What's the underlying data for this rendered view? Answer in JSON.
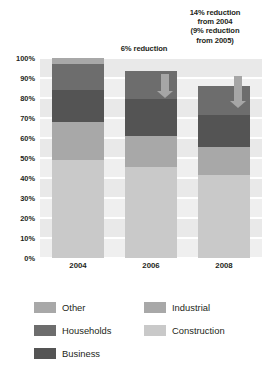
{
  "annotations": {
    "a2006": "6% reduction",
    "a2008": "14% reduction\nfrom 2004\n(9% reduction\nfrom 2005)"
  },
  "legend": {
    "items": [
      {
        "label": "Other",
        "color": "#a8a8a8"
      },
      {
        "label": "Households",
        "color": "#6d6d6d"
      },
      {
        "label": "Business",
        "color": "#545454"
      },
      {
        "label": "Industrial",
        "color": "#a8a8a8"
      },
      {
        "label": "Construction",
        "color": "#c9c9c9"
      }
    ]
  },
  "chart_data": {
    "type": "bar",
    "subtype": "stacked",
    "title": "",
    "xlabel": "",
    "ylabel": "",
    "categories": [
      "2004",
      "2006",
      "2008"
    ],
    "ylim": [
      0,
      100
    ],
    "ytick_labels": [
      "0%",
      "10%",
      "20%",
      "30%",
      "40%",
      "50%",
      "60%",
      "70%",
      "80%",
      "90%",
      "100%"
    ],
    "ytick_values": [
      0,
      10,
      20,
      30,
      40,
      50,
      60,
      70,
      80,
      90,
      100
    ],
    "grid": true,
    "legend_position": "bottom",
    "series": [
      {
        "name": "Construction",
        "color": "#c9c9c9",
        "values": [
          49.0,
          45.5,
          41.5
        ]
      },
      {
        "name": "Industrial",
        "color": "#a8a8a8",
        "values": [
          19.0,
          15.5,
          14.0
        ]
      },
      {
        "name": "Business",
        "color": "#545454",
        "values": [
          16.0,
          18.5,
          16.0
        ]
      },
      {
        "name": "Households",
        "color": "#6d6d6d",
        "values": [
          13.0,
          14.0,
          14.5
        ]
      },
      {
        "name": "Other",
        "color": "#a8a8a8",
        "values": [
          3.0,
          0.0,
          0.0
        ]
      }
    ],
    "totals": [
      100.0,
      93.5,
      86.0
    ],
    "annotations": [
      {
        "at": "2006",
        "text": "6% reduction"
      },
      {
        "at": "2008",
        "text": "14% reduction from 2004 (9% reduction from 2005)"
      }
    ]
  }
}
